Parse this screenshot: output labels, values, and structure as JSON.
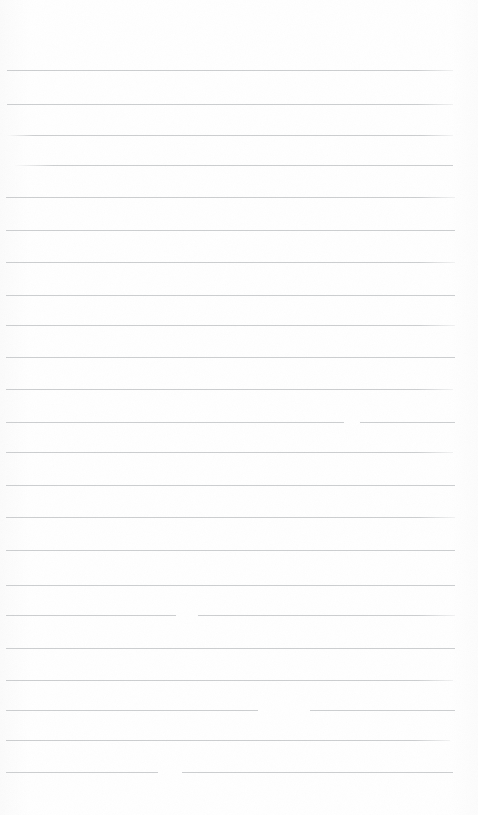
{
  "document": {
    "kind": "scanned-lined-paper",
    "title": "Blank Ruled Notepad Page",
    "page_width": 478,
    "page_height": 815,
    "background_color": "#fefefe",
    "rule_color": "#c9cbcd",
    "rule_thickness": 1,
    "left_margin": 7,
    "right_margin": 23,
    "top_margin": 70,
    "bottom_margin": 43,
    "line_spacing": 32,
    "line_count": 23,
    "has_text_content": false,
    "has_margin_rule": false,
    "notes_text": ""
  },
  "ruled_lines": [
    {
      "index": 1,
      "y": 70,
      "x_start": 7,
      "x_end": 453,
      "fade": "fade-right",
      "gaps": []
    },
    {
      "index": 2,
      "y": 104,
      "x_start": 7,
      "x_end": 453,
      "fade": "fade-right",
      "gaps": []
    },
    {
      "index": 3,
      "y": 135,
      "x_start": 7,
      "x_end": 453,
      "fade": "fade-both",
      "gaps": []
    },
    {
      "index": 4,
      "y": 165,
      "x_start": 14,
      "x_end": 453,
      "fade": "fade-left",
      "gaps": []
    },
    {
      "index": 5,
      "y": 197,
      "x_start": 6,
      "x_end": 455,
      "fade": "fade-right",
      "gaps": []
    },
    {
      "index": 6,
      "y": 230,
      "x_start": 6,
      "x_end": 455,
      "fade": "none",
      "gaps": []
    },
    {
      "index": 7,
      "y": 262,
      "x_start": 6,
      "x_end": 455,
      "fade": "fade-right",
      "gaps": []
    },
    {
      "index": 8,
      "y": 295,
      "x_start": 6,
      "x_end": 455,
      "fade": "none",
      "gaps": []
    },
    {
      "index": 9,
      "y": 325,
      "x_start": 6,
      "x_end": 455,
      "fade": "fade-right",
      "gaps": []
    },
    {
      "index": 10,
      "y": 357,
      "x_start": 6,
      "x_end": 455,
      "fade": "none",
      "gaps": []
    },
    {
      "index": 11,
      "y": 389,
      "x_start": 6,
      "x_end": 453,
      "fade": "fade-right",
      "gaps": []
    },
    {
      "index": 12,
      "y": 422,
      "x_start": 6,
      "x_end": 455,
      "fade": "none",
      "gaps": [
        {
          "x": 344,
          "width": 16
        }
      ]
    },
    {
      "index": 13,
      "y": 452,
      "x_start": 6,
      "x_end": 453,
      "fade": "fade-right",
      "gaps": []
    },
    {
      "index": 14,
      "y": 485,
      "x_start": 6,
      "x_end": 455,
      "fade": "none",
      "gaps": []
    },
    {
      "index": 15,
      "y": 517,
      "x_start": 6,
      "x_end": 455,
      "fade": "fade-right",
      "gaps": []
    },
    {
      "index": 16,
      "y": 550,
      "x_start": 6,
      "x_end": 455,
      "fade": "none",
      "gaps": []
    },
    {
      "index": 17,
      "y": 585,
      "x_start": 6,
      "x_end": 455,
      "fade": "none",
      "gaps": []
    },
    {
      "index": 18,
      "y": 615,
      "x_start": 6,
      "x_end": 455,
      "fade": "fade-right",
      "gaps": [
        {
          "x": 176,
          "width": 22
        }
      ]
    },
    {
      "index": 19,
      "y": 648,
      "x_start": 6,
      "x_end": 455,
      "fade": "none",
      "gaps": []
    },
    {
      "index": 20,
      "y": 680,
      "x_start": 6,
      "x_end": 453,
      "fade": "fade-right",
      "gaps": []
    },
    {
      "index": 21,
      "y": 710,
      "x_start": 6,
      "x_end": 455,
      "fade": "none",
      "gaps": [
        {
          "x": 258,
          "width": 52
        }
      ]
    },
    {
      "index": 22,
      "y": 740,
      "x_start": 6,
      "x_end": 450,
      "fade": "fade-right",
      "gaps": []
    },
    {
      "index": 23,
      "y": 772,
      "x_start": 6,
      "x_end": 453,
      "fade": "none",
      "gaps": [
        {
          "x": 158,
          "width": 24
        }
      ]
    }
  ]
}
